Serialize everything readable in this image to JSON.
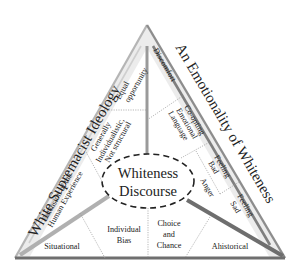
{
  "diagram": {
    "center": {
      "line1": "Whiteness",
      "line2": "Discourse"
    },
    "left_side": {
      "title": "White Supremacist Ideology",
      "items": [
        {
          "lines": [
            "Equal",
            "opportunity"
          ]
        },
        {
          "lines": [
            "Generally",
            "Individualistic,",
            "Not structural"
          ]
        },
        {
          "lines": [
            "Extension of the",
            "Human Experience"
          ]
        }
      ]
    },
    "right_side": {
      "title": "An Emotionality of Whiteness",
      "items": [
        {
          "lines": [
            "Discomfort"
          ]
        },
        {
          "lines": [
            "Co-opting",
            "Emotional",
            "Language"
          ]
        },
        {
          "lines": [
            "Feeling",
            "Bad"
          ]
        },
        {
          "lines": [
            "Anger"
          ]
        },
        {
          "lines": [
            "Feeling",
            "Sad"
          ]
        }
      ]
    },
    "bottom_side": {
      "items": [
        {
          "lines": [
            "Situational"
          ]
        },
        {
          "lines": [
            "Individual",
            "Bias"
          ]
        },
        {
          "lines": [
            "Choice",
            "and",
            "Chance"
          ]
        },
        {
          "lines": [
            "Ahistorical"
          ]
        }
      ]
    },
    "colors": {
      "outer_edge": "#8a8a8a",
      "title_band": "#d9d9d9",
      "inner_divider": "#9a9a9a",
      "thick_divider": "#6e6e6e",
      "dotted": "#9a9a9a",
      "text": "#222222"
    }
  }
}
